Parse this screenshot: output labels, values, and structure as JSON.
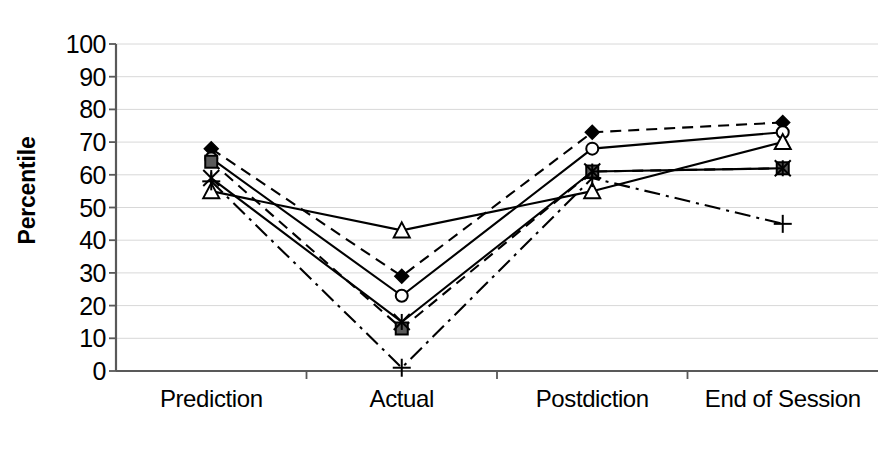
{
  "chart_data": {
    "type": "line",
    "title": "",
    "subtitle": "",
    "xlabel": "",
    "ylabel": "Percentile",
    "categories": [
      "Prediction",
      "Actual",
      "Postdiction",
      "End of Session"
    ],
    "ylim": [
      0,
      100
    ],
    "ytick_step": 10,
    "yticks": [
      "0",
      "10",
      "20",
      "30",
      "40",
      "50",
      "60",
      "70",
      "80",
      "90",
      "100"
    ],
    "grid": "horizontal",
    "legend": "none",
    "annotations": [],
    "series": [
      {
        "name": "series-diamond",
        "marker": "diamond-filled",
        "line_style": "dashed",
        "color": "#000000",
        "values": [
          68,
          29,
          73,
          76
        ]
      },
      {
        "name": "series-circle",
        "marker": "circle-open",
        "line_style": "solid",
        "color": "#000000",
        "values": [
          65,
          23,
          68,
          73
        ]
      },
      {
        "name": "series-square",
        "marker": "square-filled",
        "line_style": "dashed",
        "color": "#000000",
        "values": [
          64,
          13,
          61,
          62
        ]
      },
      {
        "name": "series-triangle",
        "marker": "triangle-open",
        "line_style": "solid",
        "color": "#000000",
        "values": [
          55,
          43,
          55,
          70
        ]
      },
      {
        "name": "series-star",
        "marker": "star-x",
        "line_style": "solid",
        "color": "#000000",
        "values": [
          59,
          15,
          61,
          62
        ]
      },
      {
        "name": "series-plus",
        "marker": "plus",
        "line_style": "dash-dot",
        "color": "#000000",
        "values": [
          58,
          1,
          59,
          45
        ]
      }
    ]
  },
  "axes": {
    "y_axis_title": "Percentile",
    "y_min_label": "0",
    "y_max_label": "100"
  }
}
